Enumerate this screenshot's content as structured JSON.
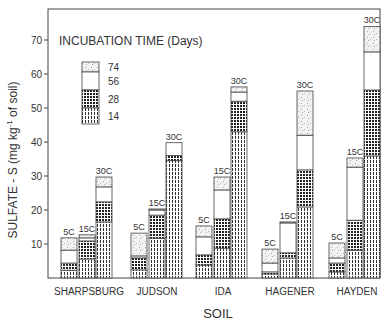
{
  "chart_data": {
    "type": "bar",
    "stacked": true,
    "title": "",
    "xlabel": "SOIL",
    "ylabel": "SULFATE - S (mg kg-1 of soil)",
    "ylabel_parts": {
      "main": "SULFATE - S (mg kg",
      "sup": "-1",
      "tail": " of soil)"
    },
    "ylim": [
      0,
      76
    ],
    "yticks": [
      10,
      20,
      30,
      40,
      50,
      60,
      70
    ],
    "grid": false,
    "legend": {
      "title": "INCUBATION TIME (Days)",
      "position": "upper-left",
      "entries": [
        "74",
        "56",
        "28",
        "14"
      ]
    },
    "categories": [
      "SHARPSBURG",
      "JUDSON",
      "IDA",
      "HAGENER",
      "HAYDEN"
    ],
    "temperatures": [
      "5C",
      "15C",
      "30C"
    ],
    "series_stack_order": [
      "14",
      "28",
      "56",
      "74"
    ],
    "cumulative_values": {
      "SHARPSBURG": {
        "5C": {
          "14": 2.3,
          "28": 4.4,
          "56": 8.2,
          "74": 11.8
        },
        "15C": {
          "14": 5.6,
          "28": 10.9,
          "56": 11.8,
          "74": 12.7
        },
        "30C": {
          "14": 16.5,
          "28": 22.4,
          "56": 26.8,
          "74": 29.7
        }
      },
      "JUDSON": {
        "5C": {
          "14": 2.4,
          "28": 5.9,
          "56": 6.5,
          "74": 13.2
        },
        "15C": {
          "14": 11.7,
          "28": 18.5,
          "56": 20.0,
          "74": 20.3
        },
        "30C": {
          "14": 34.5,
          "28": 36.0,
          "56": 39.8,
          "74": 39.8
        }
      },
      "IDA": {
        "5C": {
          "14": 3.8,
          "28": 6.8,
          "56": 12.1,
          "74": 15.3
        },
        "15C": {
          "14": 8.8,
          "28": 17.4,
          "56": 25.9,
          "74": 29.7
        },
        "30C": {
          "14": 43.0,
          "28": 52.0,
          "56": 54.7,
          "74": 56.2
        }
      },
      "HAGENER": {
        "5C": {
          "14": 1.2,
          "28": 1.8,
          "56": 4.4,
          "74": 8.5
        },
        "15C": {
          "14": 5.9,
          "28": 7.4,
          "56": 16.2,
          "74": 16.5
        },
        "30C": {
          "14": 20.9,
          "28": 31.8,
          "56": 42.0,
          "74": 55.0
        }
      },
      "HAYDEN": {
        "5C": {
          "14": 1.8,
          "28": 4.4,
          "56": 5.9,
          "74": 10.3
        },
        "15C": {
          "14": 8.2,
          "28": 17.0,
          "56": 32.6,
          "74": 35.3
        },
        "30C": {
          "14": 35.9,
          "28": 55.3,
          "56": 66.5,
          "74": 74.0
        }
      }
    },
    "series": [
      {
        "name": "14",
        "values_5C": [
          2.3,
          2.4,
          3.8,
          1.2,
          1.8
        ],
        "values_15C": [
          5.6,
          11.7,
          8.8,
          5.9,
          8.2
        ],
        "values_30C": [
          16.5,
          34.5,
          43.0,
          20.9,
          35.9
        ]
      },
      {
        "name": "28",
        "values_5C": [
          2.1,
          3.5,
          3.0,
          0.6,
          2.6
        ],
        "values_15C": [
          5.3,
          6.8,
          8.6,
          1.5,
          8.8
        ],
        "values_30C": [
          5.9,
          1.5,
          9.0,
          10.9,
          19.4
        ]
      },
      {
        "name": "56",
        "values_5C": [
          3.8,
          0.6,
          5.3,
          2.6,
          1.5
        ],
        "values_15C": [
          0.9,
          1.5,
          8.5,
          8.8,
          15.6
        ],
        "values_30C": [
          4.4,
          3.8,
          2.7,
          10.2,
          11.2
        ]
      },
      {
        "name": "74",
        "values_5C": [
          3.6,
          6.7,
          3.2,
          4.1,
          4.4
        ],
        "values_15C": [
          0.9,
          0.3,
          3.8,
          0.3,
          2.7
        ],
        "values_30C": [
          2.9,
          0.0,
          1.5,
          13.0,
          7.5
        ]
      }
    ]
  },
  "colors": {
    "ink": "#333333",
    "frame": "#444444",
    "fill_56": "#ffffff",
    "fill_74": "#e8e8e8"
  }
}
